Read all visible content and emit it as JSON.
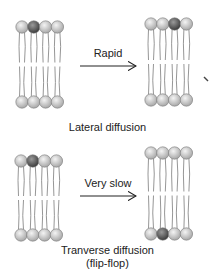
{
  "figure": {
    "colors": {
      "head_light": "#d8d8d8",
      "head_dark": "#6a6a6a",
      "tail": "#888888",
      "arrow": "#222222",
      "text": "#222222"
    },
    "panels": [
      {
        "name": "lateral",
        "arrow_label": "Rapid",
        "caption": "Lateral diffusion",
        "before": {
          "top_dark_index": 1,
          "bottom_dark_index": -1
        },
        "after": {
          "top_dark_index": 2,
          "bottom_dark_index": -1
        }
      },
      {
        "name": "transverse",
        "arrow_label": "Very slow",
        "caption_line1": "Tranverse diffusion",
        "caption_line2": "(flip-flop)",
        "before": {
          "top_dark_index": 1,
          "bottom_dark_index": -1
        },
        "after": {
          "top_dark_index": -1,
          "bottom_dark_index": 1
        }
      }
    ]
  }
}
